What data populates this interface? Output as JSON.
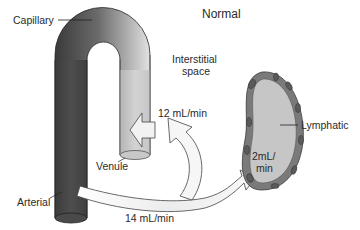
{
  "title": "Normal",
  "labels": {
    "capillary": "Capillary",
    "interstitial_line1": "Interstitial",
    "interstitial_line2": "space",
    "venule": "Venule",
    "arterial": "Arterial",
    "lymphatic": "Lymphatic"
  },
  "flows": {
    "filtration": "14 mL/min",
    "reabsorption": "12 mL/min",
    "lymph_line1": "2mL/",
    "lymph_line2": "min"
  },
  "colors": {
    "arterial_dark": "#3c3c3c",
    "venous_light": "#d8d8d8",
    "lymph_fill": "#c4c4c4",
    "lymph_wall": "#7a7a7a",
    "arrow_fill": "#f4f4f4"
  }
}
